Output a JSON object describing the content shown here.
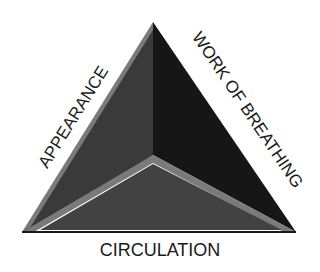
{
  "diagram": {
    "type": "triangle",
    "labels": {
      "left": "APPEARANCE",
      "right": "WORK OF BREATHING",
      "bottom": "CIRCULATION"
    },
    "colors": {
      "background": "#ffffff",
      "left_face": "#3a3a3a",
      "right_face": "#161616",
      "bottom_face": "#404040",
      "bevel_light": "#7a7a7a",
      "bevel_mid": "#5c5c5c",
      "text": "#1a1a1a"
    }
  }
}
